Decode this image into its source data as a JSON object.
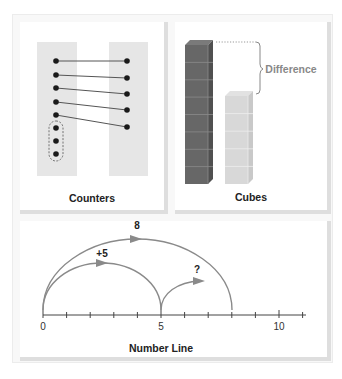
{
  "panels": {
    "counters": {
      "caption": "Counters",
      "left_column_count": 8,
      "right_column_count": 5,
      "matched_pairs": 5,
      "unmatched_grouped": 3
    },
    "cubes": {
      "caption": "Cubes",
      "difference_label": "Difference",
      "tall_tower_cubes": 8,
      "short_tower_cubes": 5,
      "colors": {
        "tall": "#6b6b6b",
        "short": "#d9d9d9"
      }
    },
    "number_line": {
      "caption": "Number Line",
      "tick_labels": [
        "0",
        "5",
        "10"
      ],
      "range": [
        0,
        11
      ],
      "jumps": [
        {
          "label": "8",
          "from": 0,
          "to": 8
        },
        {
          "label": "+5",
          "from": 0,
          "to": 5
        },
        {
          "label": "?",
          "from": 5,
          "to": 8
        }
      ]
    }
  },
  "colors": {
    "line": "#555555",
    "arc": "#8a8a8a",
    "strip": "#e6e6e6",
    "dot": "#1a1a1a"
  }
}
